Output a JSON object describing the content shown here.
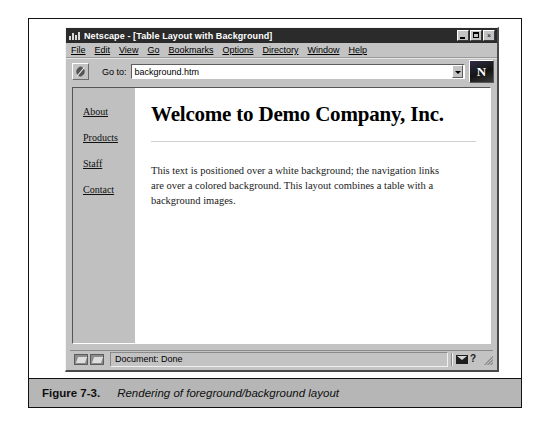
{
  "browser": {
    "titlebar": {
      "app_name": "Netscape",
      "title": "Netscape - [Table Layout with Background]",
      "minimize_label": "_",
      "maximize_label": "",
      "close_label": "×"
    },
    "menubar": {
      "items": [
        {
          "label": "File",
          "accel": "F"
        },
        {
          "label": "Edit",
          "accel": "E"
        },
        {
          "label": "View",
          "accel": "V"
        },
        {
          "label": "Go",
          "accel": "G"
        },
        {
          "label": "Bookmarks",
          "accel": "B"
        },
        {
          "label": "Options",
          "accel": "O"
        },
        {
          "label": "Directory",
          "accel": "D"
        },
        {
          "label": "Window",
          "accel": "W"
        },
        {
          "label": "Help",
          "accel": "H"
        }
      ]
    },
    "location_bar": {
      "goto_label": "Go to:",
      "url_value": "background.htm",
      "url_placeholder": "",
      "logo_letter": "N"
    },
    "statusbar": {
      "message": "Document: Done",
      "help_symbol": "?"
    }
  },
  "webpage": {
    "nav": {
      "links": [
        {
          "label": "About"
        },
        {
          "label": "Products"
        },
        {
          "label": "Staff"
        },
        {
          "label": "Contact"
        }
      ]
    },
    "heading": "Welcome to Demo Company, Inc.",
    "paragraph": "This text is positioned over a white background; the navigation links are over a colored background. This layout combines a table with a background images."
  },
  "figure": {
    "number": "Figure 7-3.",
    "caption": "Rendering of foreground/background layout"
  },
  "colors": {
    "chrome": "#c3c3c3",
    "titlebar": "#2b2b2b",
    "nav_background": "#c0c0c0",
    "content_background": "#ffffff",
    "caption_band": "#b6b6b6"
  }
}
